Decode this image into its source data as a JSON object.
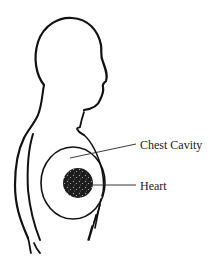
{
  "diagram": {
    "labels": [
      {
        "id": "chest-cavity",
        "text": "Chest Cavity"
      },
      {
        "id": "heart",
        "text": "Heart"
      }
    ],
    "colors": {
      "outline": "#111111",
      "heart_fill": "#1c1c1c",
      "background": "#ffffff"
    }
  }
}
